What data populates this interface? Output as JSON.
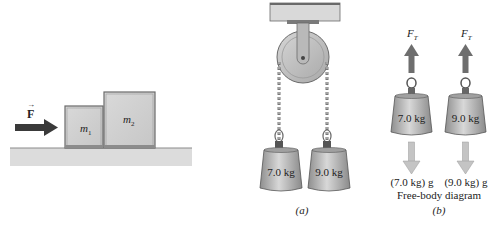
{
  "left_panel": {
    "force_label": "F",
    "force_vector_mark": "→",
    "block1_label": "m",
    "block1_sub": "1",
    "block2_label": "m",
    "block2_sub": "2"
  },
  "panel_a": {
    "weight_left": "7.0 kg",
    "weight_right": "9.0 kg",
    "caption": "(a)"
  },
  "panel_b": {
    "tension_label": "F",
    "tension_sub": "T",
    "weight_left": "7.0 kg",
    "weight_right": "9.0 kg",
    "gravity_left": "(7.0 kg) g",
    "gravity_right": "(9.0 kg) g",
    "title": "Free-body diagram",
    "caption": "(b)"
  },
  "colors": {
    "block_fill": "#d2d2d2",
    "block_edge": "#6a6a6a",
    "floor": "#dcdcdc",
    "arrow_dark": "#3a3a3a",
    "tension_arrow": "#6e6e6e",
    "gravity_arrow": "#bdbdbd",
    "weight_fill": "#b4b4b4"
  }
}
